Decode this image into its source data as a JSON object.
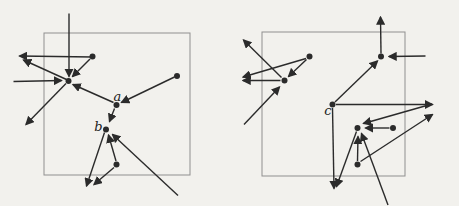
{
  "figure": {
    "background_color": "#f2f1ed",
    "arrow_color": "#2b2b2b",
    "box_color": "#8f8f8f",
    "dot_radius": 3,
    "diagrams": [
      {
        "name": "left",
        "box": {
          "x": 44,
          "y": 33,
          "w": 146,
          "h": 142
        },
        "points": [
          {
            "x": 68.5,
            "y": 81
          },
          {
            "x": 92.5,
            "y": 56.5
          },
          {
            "x": 177,
            "y": 76
          },
          {
            "x": 116.5,
            "y": 105
          },
          {
            "x": 106,
            "y": 129.5
          },
          {
            "x": 116.5,
            "y": 164.5
          }
        ],
        "labels": [
          {
            "text": "a",
            "x": 117.5,
            "y": 97
          },
          {
            "text": "b",
            "x": 98.5,
            "y": 127.5
          }
        ],
        "arrows": [
          {
            "x1": 69,
            "y1": 13.5,
            "x2": 69,
            "y2": 76.5
          },
          {
            "x1": 92.5,
            "y1": 57,
            "x2": 19.5,
            "y2": 56
          },
          {
            "x1": 66.5,
            "y1": 79.5,
            "x2": 23.5,
            "y2": 60
          },
          {
            "x1": 13.5,
            "y1": 81.5,
            "x2": 61.5,
            "y2": 80.5
          },
          {
            "x1": 90,
            "y1": 59,
            "x2": 72.5,
            "y2": 76.5
          },
          {
            "x1": 113.5,
            "y1": 102.5,
            "x2": 73,
            "y2": 84.5
          },
          {
            "x1": 66,
            "y1": 83.5,
            "x2": 26,
            "y2": 124.5
          },
          {
            "x1": 174.5,
            "y1": 77,
            "x2": 121.5,
            "y2": 102.5
          },
          {
            "x1": 114.5,
            "y1": 108.5,
            "x2": 109.5,
            "y2": 121.5
          },
          {
            "x1": 104.5,
            "y1": 132.5,
            "x2": 86.5,
            "y2": 186
          },
          {
            "x1": 116,
            "y1": 161,
            "x2": 108.5,
            "y2": 135
          },
          {
            "x1": 178,
            "y1": 195.5,
            "x2": 112.5,
            "y2": 134.5
          },
          {
            "x1": 114,
            "y1": 167.5,
            "x2": 94,
            "y2": 184.5
          }
        ]
      },
      {
        "name": "right",
        "box": {
          "x": 262,
          "y": 32,
          "w": 143,
          "h": 144
        },
        "points": [
          {
            "x": 309.5,
            "y": 56.5
          },
          {
            "x": 284.5,
            "y": 80.5
          },
          {
            "x": 381,
            "y": 56.5
          },
          {
            "x": 332.5,
            "y": 104.5
          },
          {
            "x": 357.5,
            "y": 128
          },
          {
            "x": 393,
            "y": 128
          },
          {
            "x": 357.5,
            "y": 164.5
          }
        ],
        "labels": [
          {
            "text": "c",
            "x": 328,
            "y": 111.5
          }
        ],
        "arrows": [
          {
            "x1": 381,
            "y1": 53.5,
            "x2": 380.5,
            "y2": 17
          },
          {
            "x1": 425.5,
            "y1": 56,
            "x2": 389,
            "y2": 56.5
          },
          {
            "x1": 335,
            "y1": 102,
            "x2": 377.5,
            "y2": 61
          },
          {
            "x1": 306.5,
            "y1": 59.5,
            "x2": 288.5,
            "y2": 76.5
          },
          {
            "x1": 306,
            "y1": 58.5,
            "x2": 243,
            "y2": 77
          },
          {
            "x1": 280.5,
            "y1": 80.5,
            "x2": 243,
            "y2": 80.5
          },
          {
            "x1": 281.5,
            "y1": 77.5,
            "x2": 243.5,
            "y2": 40
          },
          {
            "x1": 244,
            "y1": 124.5,
            "x2": 279.5,
            "y2": 87
          },
          {
            "x1": 336,
            "y1": 104.5,
            "x2": 432.5,
            "y2": 104.5
          },
          {
            "x1": 332.5,
            "y1": 108,
            "x2": 334,
            "y2": 188.5
          },
          {
            "x1": 356.5,
            "y1": 131.5,
            "x2": 336.5,
            "y2": 186.5
          },
          {
            "x1": 389.5,
            "y1": 128,
            "x2": 365.5,
            "y2": 128
          },
          {
            "x1": 357.5,
            "y1": 161,
            "x2": 358,
            "y2": 136.5
          },
          {
            "x1": 388,
            "y1": 205,
            "x2": 361.5,
            "y2": 133.5
          },
          {
            "x1": 432,
            "y1": 104,
            "x2": 363.5,
            "y2": 123.5
          },
          {
            "x1": 360.5,
            "y1": 161.5,
            "x2": 432.5,
            "y2": 114.5
          }
        ]
      }
    ]
  }
}
